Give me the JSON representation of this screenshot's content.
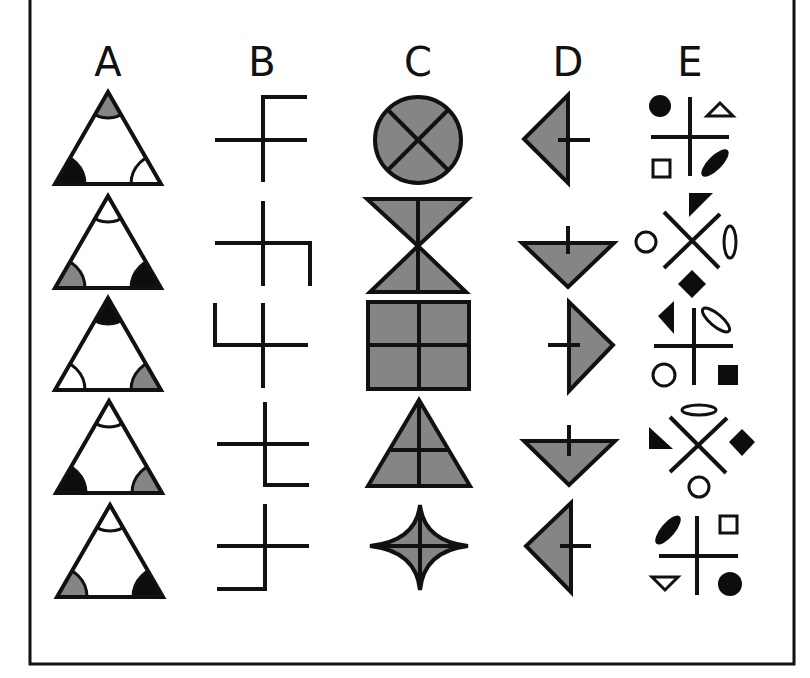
{
  "figure": {
    "title": "",
    "columns": [
      {
        "label": "A",
        "description": "Triangles with shaded corner arcs (white, gray, black)"
      },
      {
        "label": "B",
        "description": "Crosses with an L-shaped extension in varying positions"
      },
      {
        "label": "C",
        "description": "Gray filled shapes divided by lines"
      },
      {
        "label": "D",
        "description": "Gray triangles with a short tick line"
      },
      {
        "label": "E",
        "description": "Crossed lines surrounded by four small symbols"
      }
    ],
    "rows": [
      {
        "index": 1,
        "A": {
          "top": "gray",
          "left": "black",
          "right": "white"
        },
        "B": {
          "extension": "top-right",
          "shape": "vertical line bends right at top"
        },
        "C": {
          "shape": "circle",
          "divider": "X"
        },
        "D": {
          "triangle": "pointing-left",
          "tick": "right"
        },
        "E": {
          "cross": "plus",
          "top_left": "filled-circle",
          "top_right": "open-triangle",
          "bottom_left": "open-square",
          "bottom_right": "filled-ellipse"
        }
      },
      {
        "index": 2,
        "A": {
          "top": "white",
          "left": "gray",
          "right": "black"
        },
        "B": {
          "extension": "right-down",
          "shape": "horizontal line bends down at right"
        },
        "C": {
          "shape": "hourglass",
          "divider": "vertical"
        },
        "D": {
          "triangle": "pointing-down",
          "tick": "up"
        },
        "E": {
          "cross": "x",
          "top": "filled-triangle",
          "left": "open-circle",
          "right": "open-ellipse-vertical",
          "bottom": "filled-diamond"
        }
      },
      {
        "index": 3,
        "A": {
          "top": "black",
          "left": "white",
          "right": "gray"
        },
        "B": {
          "extension": "left-up",
          "shape": "horizontal line bends up at left"
        },
        "C": {
          "shape": "square",
          "divider": "plus"
        },
        "D": {
          "triangle": "pointing-right",
          "tick": "left"
        },
        "E": {
          "cross": "plus",
          "top_left": "filled-triangle",
          "top_right": "open-ellipse",
          "bottom_left": "open-circle",
          "bottom_right": "filled-square"
        }
      },
      {
        "index": 4,
        "A": {
          "top": "white",
          "left": "black",
          "right": "gray"
        },
        "B": {
          "extension": "bottom-right",
          "shape": "vertical line bends right at bottom"
        },
        "C": {
          "shape": "triangle",
          "divider": "plus"
        },
        "D": {
          "triangle": "pointing-down",
          "tick": "up"
        },
        "E": {
          "cross": "x",
          "top": "open-ellipse-horizontal",
          "left": "filled-triangle",
          "right": "filled-diamond",
          "bottom": "open-circle"
        }
      },
      {
        "index": 5,
        "A": {
          "top": "white",
          "left": "gray",
          "right": "black"
        },
        "B": {
          "extension": "bottom-left",
          "shape": "vertical line bends left at bottom"
        },
        "C": {
          "shape": "four-pointed-star",
          "divider": "plus"
        },
        "D": {
          "triangle": "pointing-left",
          "tick": "right"
        },
        "E": {
          "cross": "plus",
          "top_left": "filled-ellipse",
          "top_right": "open-square",
          "bottom_left": "open-triangle",
          "bottom_right": "filled-circle"
        }
      }
    ]
  },
  "colors": {
    "stroke": "#111111",
    "gray_fill": "#858585",
    "black_fill": "#0d0d0d",
    "background": "#ffffff"
  }
}
